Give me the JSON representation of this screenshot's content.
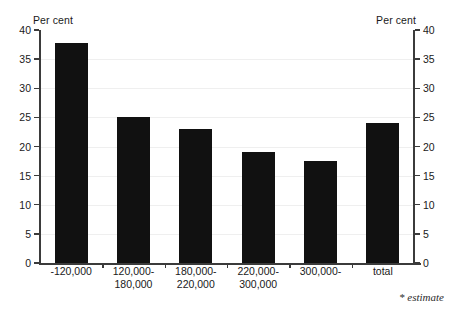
{
  "axis": {
    "left_unit_label": "Per cent",
    "right_unit_label": "Per cent",
    "tick_labels": [
      "0",
      "5",
      "10",
      "15",
      "20",
      "25",
      "30",
      "35",
      "40"
    ]
  },
  "footnote": {
    "text": "* estimate"
  },
  "colors": {
    "bar": "#111111",
    "axis": "#3b3b3b",
    "grid": "#efefef",
    "text": "#1a1a1a",
    "background": "#ffffff"
  },
  "chart_data": {
    "type": "bar",
    "title": "",
    "subtitle": "",
    "xlabel": "",
    "ylabel": "Per cent",
    "y2label": "Per cent",
    "ylim": [
      0,
      40
    ],
    "yticks": [
      0,
      5,
      10,
      15,
      20,
      25,
      30,
      35,
      40
    ],
    "grid": true,
    "legend": false,
    "categories": [
      "-120,000",
      "120,000-\n180,000",
      "180,000-\n220,000",
      "220,000-\n300,000",
      "300,000-",
      "total"
    ],
    "values": [
      37.8,
      25.0,
      23.0,
      19.0,
      17.5,
      24.0
    ],
    "annotations": [
      "* estimate"
    ]
  }
}
